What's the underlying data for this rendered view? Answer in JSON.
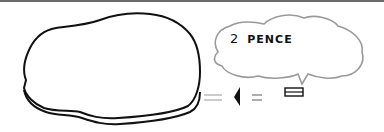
{
  "sketch": {
    "bubble": {
      "amount": "2",
      "unit": "PENCE"
    },
    "legend": {
      "arrow_icon": "left-pointing-triangle-icon",
      "equals": "=",
      "coin_edge_icon": "coin-edge-rectangle-icon"
    },
    "colors": {
      "ink": "#111111",
      "bubble_outline": "#9a9a9a",
      "rule": "#6a6a6a",
      "background": "#ffffff"
    }
  }
}
